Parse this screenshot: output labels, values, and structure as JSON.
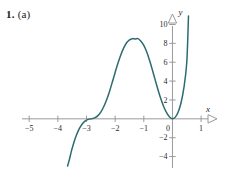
{
  "exercise": {
    "number": "1.",
    "part": "(a)"
  },
  "chart_data": {
    "type": "line",
    "title": "",
    "xlabel": "x",
    "ylabel": "y",
    "xlim": [
      -5.6,
      1.45
    ],
    "ylim": [
      -5.0,
      10.9
    ],
    "grid": false,
    "legend": "none",
    "axis_arrows": "open-triangle",
    "origin_label": "0",
    "xticks": [
      -5,
      -4,
      -3,
      -2,
      -1,
      0,
      1
    ],
    "xtick_labels": [
      "−5",
      "−4",
      "−3",
      "−2",
      "−1",
      "0",
      "1"
    ],
    "yticks": [
      -4,
      -2,
      0,
      2,
      4,
      6,
      8,
      10
    ],
    "ytick_labels": [
      "−4",
      "−2",
      "0",
      "2",
      "4",
      "6",
      "8",
      "10"
    ],
    "curve_color": "#2d6b72",
    "axis_color": "#9a9a9a",
    "features": {
      "local_maximum": {
        "x": -1.2,
        "y": 8.5
      },
      "tangential_minimum": {
        "x": 0,
        "y": 0
      },
      "saddle_inflection": {
        "x": -3,
        "y": 0
      },
      "left_exit": {
        "x": -3.65,
        "y": -5
      },
      "right_exit": {
        "x": 0.56,
        "y": 10.9
      }
    },
    "series": [
      {
        "name": "curve",
        "x": [
          -3.66,
          -3.6,
          -3.52,
          -3.44,
          -3.36,
          -3.28,
          -3.2,
          -3.12,
          -3.04,
          -2.96,
          -2.88,
          -2.8,
          -2.7,
          -2.6,
          -2.5,
          -2.4,
          -2.3,
          -2.2,
          -2.1,
          -2.0,
          -1.9,
          -1.8,
          -1.7,
          -1.6,
          -1.5,
          -1.4,
          -1.3,
          -1.2,
          -1.1,
          -1.0,
          -0.9,
          -0.8,
          -0.7,
          -0.6,
          -0.5,
          -0.4,
          -0.3,
          -0.2,
          -0.1,
          0.0,
          0.1,
          0.2,
          0.3,
          0.4,
          0.5,
          0.56
        ],
        "y": [
          -5.0,
          -4.35,
          -3.35,
          -2.5,
          -1.8,
          -1.22,
          -0.78,
          -0.45,
          -0.22,
          -0.08,
          -0.02,
          0.02,
          0.12,
          0.34,
          0.72,
          1.28,
          2.0,
          2.88,
          3.88,
          4.92,
          5.92,
          6.8,
          7.52,
          8.06,
          8.37,
          8.5,
          8.47,
          8.5,
          8.22,
          7.78,
          7.1,
          6.2,
          5.18,
          4.1,
          3.03,
          2.07,
          1.26,
          0.63,
          0.2,
          0.0,
          0.18,
          0.72,
          1.7,
          3.3,
          6.0,
          10.9
        ]
      }
    ]
  }
}
